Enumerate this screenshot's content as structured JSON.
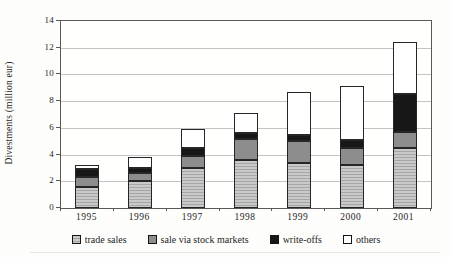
{
  "chart_data": {
    "type": "bar",
    "stacked": true,
    "title": "",
    "xlabel": "",
    "ylabel": "Divestments (million eur)",
    "ylim": [
      0,
      14
    ],
    "yticks": [
      0,
      2,
      4,
      6,
      8,
      10,
      12,
      14
    ],
    "grid": "horizontal",
    "legend_position": "bottom",
    "categories": [
      "1995",
      "1996",
      "1997",
      "1998",
      "1999",
      "2000",
      "2001"
    ],
    "series": [
      {
        "name": "trade sales",
        "color": "#b8b8b8",
        "pattern": "fine-horizontal-stripes",
        "values": [
          1.6,
          2.0,
          3.0,
          3.6,
          3.4,
          3.2,
          4.5
        ]
      },
      {
        "name": "sale via stock markets",
        "color": "#8d8d8d",
        "pattern": "solid",
        "values": [
          0.7,
          0.6,
          0.9,
          1.6,
          1.6,
          1.3,
          1.2
        ]
      },
      {
        "name": "write-offs",
        "color": "#171717",
        "pattern": "solid",
        "values": [
          0.6,
          0.4,
          0.6,
          0.4,
          0.5,
          0.6,
          2.8
        ]
      },
      {
        "name": "others",
        "color": "#ffffff",
        "pattern": "solid",
        "values": [
          0.3,
          0.8,
          1.4,
          1.5,
          3.2,
          4.0,
          3.9
        ]
      }
    ],
    "totals": [
      3.2,
      3.8,
      5.9,
      7.1,
      8.7,
      9.1,
      12.4
    ],
    "frame_color": "#595959",
    "gridline_color": "#c4c4c4"
  }
}
